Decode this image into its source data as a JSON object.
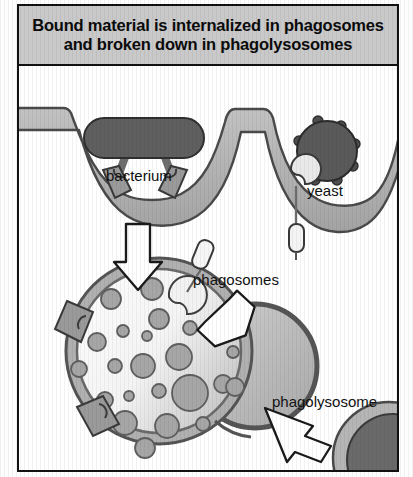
{
  "figure": {
    "title_line1": "Bound material is internalized in phagosomes",
    "title_line2": "and broken down in phagolysosomes",
    "labels": {
      "bacterium": "bacterium",
      "yeast": "yeast",
      "phagosomes": "phagosomes",
      "phagolysosome": "phagolysosome",
      "lysosome": "lysosome"
    },
    "colors": {
      "title_bg": "#c9c9c9",
      "frame_border": "#111111",
      "membrane_fill": "#b3b3b3",
      "membrane_stroke": "#4a4a4a",
      "particle_dark": "#585858",
      "receptor_fill": "#9a9a9a",
      "granule_fill": "#a6a6a6",
      "granule_stroke": "#5f5f5f",
      "lumen_fill": "#fbfbfb",
      "arrow_fill": "#ffffff",
      "arrow_stroke": "#1a1a1a",
      "lysosome_fill": "#6a6a6a"
    },
    "elements": [
      {
        "name": "cell-membrane",
        "description": "plasma membrane band with two phagocytic invaginations"
      },
      {
        "name": "bacterium-particle",
        "description": "dark rod-shaped bacterium held by receptors in left cup"
      },
      {
        "name": "yeast-particle",
        "description": "dark spiky yeast cell with bud inside right cup"
      },
      {
        "name": "phagosome-left",
        "description": "left invagination forming a phagosome"
      },
      {
        "name": "phagosome-right",
        "description": "right invagination forming a phagosome"
      },
      {
        "name": "phagolysosome-body",
        "description": "large two-lobed vacuole filled with granules"
      },
      {
        "name": "lysosome-body",
        "description": "dark lysosome at lower right fusing with phagolysosome"
      },
      {
        "name": "arrow-down",
        "description": "hollow arrow from left phagosome to phagolysosome"
      },
      {
        "name": "arrow-diagonal",
        "description": "hollow arrow from right phagosome to phagolysosome"
      },
      {
        "name": "arrow-lysosome",
        "description": "hollow arrow from lysosome to phagolysosome"
      }
    ]
  }
}
